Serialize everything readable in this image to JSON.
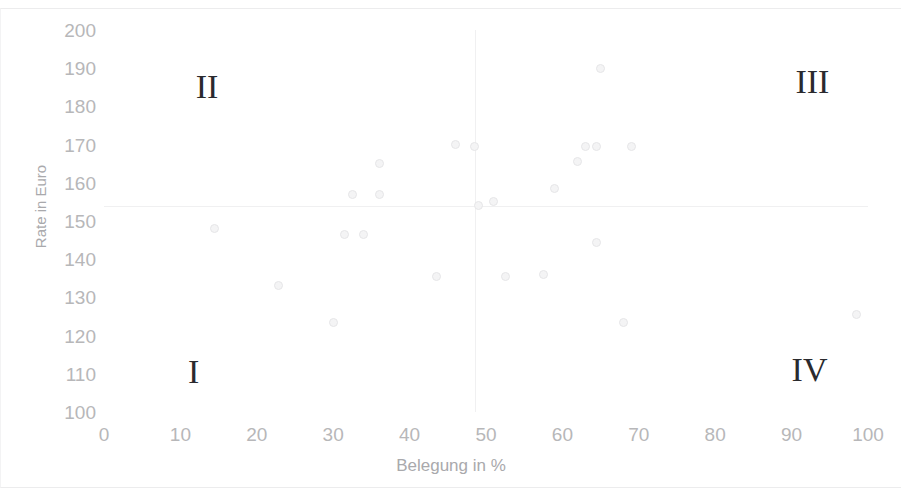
{
  "chart_data": {
    "type": "scatter",
    "title": "",
    "xlabel": "Belegung in %",
    "ylabel": "Rate in Euro",
    "xlim": [
      0,
      100
    ],
    "ylim": [
      100,
      200
    ],
    "grid": false,
    "legend": null,
    "x_ticks": [
      "0",
      "10",
      "20",
      "30",
      "40",
      "50",
      "60",
      "70",
      "80",
      "90",
      "100"
    ],
    "x_tick_values": [
      0,
      10,
      20,
      30,
      40,
      50,
      60,
      70,
      80,
      90,
      100
    ],
    "y_ticks": [
      "100",
      "110",
      "120",
      "130",
      "140",
      "150",
      "160",
      "170",
      "180",
      "190",
      "200"
    ],
    "y_tick_values": [
      100,
      110,
      120,
      130,
      140,
      150,
      160,
      170,
      180,
      190,
      200
    ],
    "marker_color": "#f4f4f5",
    "marker_edge_color": "#e6e6e8",
    "divider_color": "#f0f0f1",
    "quadrant_divider_x": 48.5,
    "quadrant_divider_y": 154,
    "points": [
      {
        "x": 14.5,
        "y": 148.0
      },
      {
        "x": 22.8,
        "y": 133.0
      },
      {
        "x": 30.0,
        "y": 123.5
      },
      {
        "x": 31.5,
        "y": 146.5
      },
      {
        "x": 34.0,
        "y": 146.5
      },
      {
        "x": 32.5,
        "y": 157.0
      },
      {
        "x": 36.0,
        "y": 157.0
      },
      {
        "x": 36.0,
        "y": 165.0
      },
      {
        "x": 43.5,
        "y": 135.5
      },
      {
        "x": 46.0,
        "y": 170.0
      },
      {
        "x": 48.5,
        "y": 169.5
      },
      {
        "x": 49.0,
        "y": 154.0
      },
      {
        "x": 51.0,
        "y": 155.0
      },
      {
        "x": 52.5,
        "y": 135.5
      },
      {
        "x": 57.5,
        "y": 136.0
      },
      {
        "x": 59.0,
        "y": 158.5
      },
      {
        "x": 62.0,
        "y": 165.5
      },
      {
        "x": 63.0,
        "y": 169.5
      },
      {
        "x": 64.5,
        "y": 169.5
      },
      {
        "x": 65.0,
        "y": 190.0
      },
      {
        "x": 64.5,
        "y": 144.5
      },
      {
        "x": 68.0,
        "y": 123.5
      },
      {
        "x": 69.0,
        "y": 169.5
      },
      {
        "x": 98.5,
        "y": 125.5
      }
    ],
    "annotations": [
      {
        "text": "II",
        "x": 12.0,
        "y": 185.0,
        "name": "quadrant-label-ii"
      },
      {
        "text": "III",
        "x": 90.5,
        "y": 186.5,
        "name": "quadrant-label-iii"
      },
      {
        "text": "I",
        "x": 11.0,
        "y": 110.5,
        "name": "quadrant-label-i"
      },
      {
        "text": "IV",
        "x": 90.0,
        "y": 111.0,
        "name": "quadrant-label-iv"
      }
    ]
  }
}
